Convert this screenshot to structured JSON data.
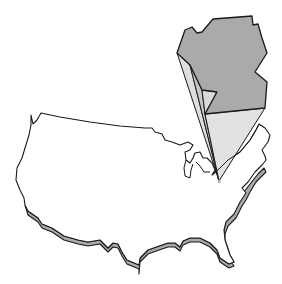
{
  "illustration": {
    "subject": "US map outline with highlighted state extruded in 3D",
    "colors": {
      "background": "#ffffff",
      "outline": "#1a1a1a",
      "map_fill": "#ffffff",
      "map_shadow": "#a9a9a9",
      "state_top": "#aaaaaa",
      "state_side_light": "#dcdcdc",
      "state_side_mid": "#c4c4c4"
    }
  }
}
